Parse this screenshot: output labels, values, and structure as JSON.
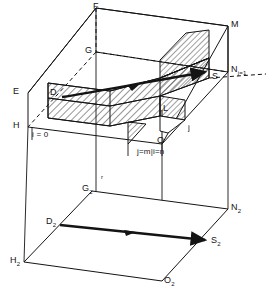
{
  "figure": {
    "type": "geometric-3d-diagram",
    "stroke_color": "#141414",
    "background_color": "#ffffff",
    "hatch_color": "#141414"
  },
  "upper_box": {
    "name": "upper-parallelepiped",
    "vertices": [
      {
        "key": "F",
        "label": "F",
        "x": 96,
        "y": 8,
        "lx": 93,
        "ly": 2
      },
      {
        "key": "M",
        "label": "M",
        "x": 228,
        "y": 26,
        "lx": 231,
        "ly": 20
      },
      {
        "key": "G",
        "label": "G",
        "x": 96,
        "y": 52,
        "lx": 85,
        "ly": 47
      },
      {
        "key": "E",
        "label": "E",
        "x": 28,
        "y": 93,
        "lx": 16,
        "ly": 88
      },
      {
        "key": "H",
        "label": "H",
        "x": 28,
        "y": 127,
        "lx": 16,
        "ly": 122
      },
      {
        "key": "N",
        "label": "N",
        "x": 228,
        "y": 72,
        "lx": 231,
        "ly": 65
      },
      {
        "key": "S",
        "label": "S",
        "x": 209,
        "y": 78,
        "lx": 212,
        "ly": 72
      },
      {
        "key": "D",
        "label": "D",
        "x": 60,
        "y": 96,
        "lx": 50,
        "ly": 89
      },
      {
        "key": "L",
        "label": "L",
        "x": 167,
        "y": 111,
        "lx": 163,
        "ly": 104
      },
      {
        "key": "O",
        "label": "O",
        "x": 162,
        "y": 144,
        "lx": 158,
        "ly": 137
      },
      {
        "key": "j",
        "label": "j",
        "x": 190,
        "y": 130,
        "lx": 188,
        "ly": 124
      }
    ],
    "subscript_labels": {
      "N_subscript": "j=1"
    },
    "annotations": [
      {
        "key": "i0",
        "text": "i = 0",
        "x": 32,
        "y": 133
      },
      {
        "key": "jmin",
        "text": "j=m|i=n",
        "x": 142,
        "y": 148
      }
    ]
  },
  "lower_plane": {
    "name": "lower-projected-plane",
    "vertices": [
      {
        "key": "G2",
        "base": "G",
        "sub": "2",
        "x": 92,
        "y": 191,
        "lx": 82,
        "ly": 185
      },
      {
        "key": "N2",
        "base": "N",
        "sub": "2",
        "x": 228,
        "y": 209,
        "lx": 231,
        "ly": 203
      },
      {
        "key": "D2",
        "base": "D",
        "sub": "2",
        "x": 58,
        "y": 224,
        "lx": 47,
        "ly": 218
      },
      {
        "key": "S2",
        "base": "S",
        "sub": "2",
        "x": 208,
        "y": 240,
        "lx": 211,
        "ly": 235
      },
      {
        "key": "H2",
        "base": "H",
        "sub": "2",
        "x": 24,
        "y": 262,
        "lx": 13,
        "ly": 257
      },
      {
        "key": "O2",
        "base": "O",
        "sub": "2",
        "x": 162,
        "y": 281,
        "lx": 165,
        "ly": 276
      }
    ],
    "annotations": [
      {
        "key": "r",
        "text": "r",
        "x": 101,
        "y": 177
      }
    ]
  },
  "arrows": [
    {
      "name": "upper-flow-arrow",
      "from": "D",
      "to": "S",
      "direction": "right"
    },
    {
      "name": "lower-flow-arrow",
      "from": "D2",
      "to": "S2",
      "direction": "right"
    }
  ]
}
